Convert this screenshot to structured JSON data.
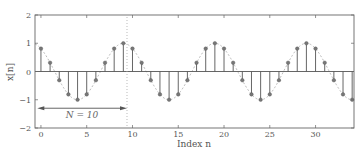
{
  "chart_data": {
    "type": "stem",
    "title": "",
    "xlabel": "Index n",
    "ylabel": "x[n]",
    "xlim": [
      -0.65,
      34.2
    ],
    "ylim": [
      -2,
      2
    ],
    "grid": false,
    "legend": null,
    "x_ticks": [
      0,
      5,
      10,
      15,
      20,
      25,
      30
    ],
    "x_tick_labels": [
      "0",
      "5",
      "10",
      "15",
      "20",
      "25",
      "30"
    ],
    "y_ticks": [
      -2,
      -1,
      0,
      1,
      2
    ],
    "y_tick_labels": [
      "−2",
      "−1",
      "0",
      "1",
      "2"
    ],
    "series": [
      {
        "name": "x[n] = cos(2π(n−9)/10)",
        "x": [
          0,
          1,
          2,
          3,
          4,
          5,
          6,
          7,
          8,
          9,
          10,
          11,
          12,
          13,
          14,
          15,
          16,
          17,
          18,
          19,
          20,
          21,
          22,
          23,
          24,
          25,
          26,
          27,
          28,
          29,
          30,
          31,
          32,
          33,
          34
        ],
        "values": [
          0.81,
          0.31,
          -0.31,
          -0.81,
          -1.0,
          -0.81,
          -0.31,
          0.31,
          0.81,
          1.0,
          0.81,
          0.31,
          -0.31,
          -0.81,
          -1.0,
          -0.81,
          -0.31,
          0.31,
          0.81,
          1.0,
          0.81,
          0.31,
          -0.31,
          -0.81,
          -1.0,
          -0.81,
          -0.31,
          0.31,
          0.81,
          1.0,
          0.81,
          0.31,
          -0.31,
          -0.81,
          -1.0
        ]
      }
    ],
    "envelope": "dashed continuous cosine, period 10",
    "annotations": [
      {
        "type": "double-arrow",
        "from_n": -0.4,
        "to_n": 9.4,
        "y": -1.3,
        "label": "N = 10"
      },
      {
        "type": "dotted-vline",
        "n": 9.4
      }
    ]
  },
  "labels": {
    "xlabel": "Index n",
    "ylabel": "x[n]",
    "period": "N = 10"
  },
  "colors": {
    "axis": "#666666",
    "stem": "#555555",
    "marker": "#777777",
    "envelope": "#aaaaaa",
    "arrow": "#555555"
  }
}
